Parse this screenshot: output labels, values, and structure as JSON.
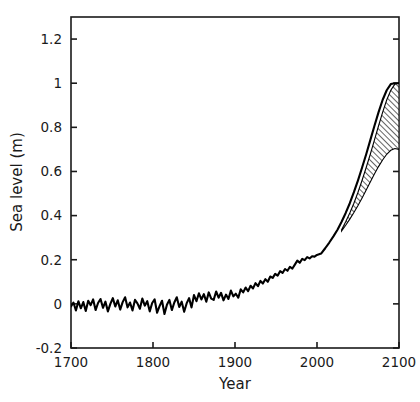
{
  "chart_data": {
    "type": "line",
    "title": "",
    "xlabel": "Year",
    "ylabel": "Sea level (m)",
    "xlim": [
      1700,
      2100
    ],
    "ylim": [
      -0.2,
      1.3
    ],
    "grid": false,
    "legend": null,
    "xticks": [
      1700,
      1800,
      1900,
      2000,
      2100
    ],
    "xtick_labels": [
      "1700",
      "1800",
      "1900",
      "2000",
      "2100"
    ],
    "yticks": [
      -0.2,
      0,
      0.2,
      0.4,
      0.6,
      0.8,
      1.0,
      1.2
    ],
    "ytick_labels": [
      "-0.2",
      "0",
      "0.2",
      "0.4",
      "0.6",
      "0.8",
      "1",
      "1.2"
    ],
    "series": [
      {
        "name": "Reconstructed and projected sea level",
        "type": "line",
        "color": "#000000",
        "x": [
          1700,
          1703,
          1706,
          1709,
          1712,
          1715,
          1718,
          1721,
          1724,
          1727,
          1730,
          1733,
          1736,
          1739,
          1742,
          1745,
          1748,
          1751,
          1754,
          1757,
          1760,
          1763,
          1766,
          1769,
          1772,
          1775,
          1778,
          1781,
          1784,
          1787,
          1790,
          1793,
          1796,
          1799,
          1802,
          1805,
          1808,
          1811,
          1814,
          1817,
          1820,
          1823,
          1826,
          1829,
          1832,
          1835,
          1838,
          1841,
          1844,
          1847,
          1850,
          1853,
          1856,
          1859,
          1862,
          1865,
          1868,
          1871,
          1874,
          1877,
          1880,
          1883,
          1886,
          1889,
          1892,
          1895,
          1898,
          1901,
          1904,
          1907,
          1910,
          1913,
          1916,
          1919,
          1922,
          1925,
          1928,
          1931,
          1934,
          1937,
          1940,
          1943,
          1946,
          1949,
          1952,
          1955,
          1958,
          1961,
          1964,
          1967,
          1970,
          1973,
          1976,
          1979,
          1982,
          1985,
          1988,
          1991,
          1994,
          1997,
          2000,
          2005,
          2010,
          2015,
          2020,
          2025,
          2030,
          2035,
          2040,
          2045,
          2050,
          2055,
          2060,
          2065,
          2070,
          2075,
          2080,
          2085,
          2090,
          2095,
          2100
        ],
        "y": [
          -0.012,
          0.006,
          -0.03,
          0.012,
          -0.02,
          0.008,
          -0.032,
          0.014,
          -0.006,
          0.02,
          -0.028,
          0.004,
          0.022,
          -0.018,
          0.01,
          -0.034,
          0.0,
          0.026,
          -0.012,
          0.016,
          -0.026,
          0.008,
          0.03,
          -0.016,
          0.006,
          -0.03,
          0.018,
          0.002,
          -0.022,
          0.024,
          -0.008,
          0.012,
          -0.034,
          0.004,
          0.02,
          -0.04,
          -0.01,
          0.014,
          -0.046,
          -0.004,
          0.018,
          -0.028,
          0.006,
          0.03,
          -0.014,
          0.01,
          -0.036,
          0.002,
          0.026,
          -0.016,
          0.04,
          0.012,
          0.048,
          0.02,
          0.044,
          0.01,
          0.052,
          0.024,
          0.018,
          0.056,
          0.028,
          0.05,
          0.016,
          0.042,
          0.022,
          0.06,
          0.034,
          0.046,
          0.028,
          0.066,
          0.052,
          0.074,
          0.058,
          0.082,
          0.07,
          0.094,
          0.08,
          0.104,
          0.092,
          0.112,
          0.1,
          0.124,
          0.118,
          0.136,
          0.128,
          0.148,
          0.14,
          0.158,
          0.15,
          0.168,
          0.16,
          0.178,
          0.196,
          0.186,
          0.204,
          0.198,
          0.212,
          0.206,
          0.216,
          0.214,
          0.222,
          0.228,
          0.252,
          0.278,
          0.306,
          0.336,
          0.372,
          0.412,
          0.456,
          0.506,
          0.56,
          0.618,
          0.678,
          0.742,
          0.806,
          0.868,
          0.924,
          0.968,
          0.996,
          1.0,
          1.0
        ]
      }
    ],
    "uncertainty_band": {
      "name": "Projection uncertainty range",
      "hatch": "/",
      "edge_color": "#000000",
      "face_color": "#ffffff",
      "start_year": 2030,
      "end_year": 2100,
      "x": [
        2030,
        2035,
        2040,
        2045,
        2050,
        2055,
        2060,
        2065,
        2070,
        2075,
        2080,
        2085,
        2090,
        2095,
        2100
      ],
      "upper": [
        0.336,
        0.372,
        0.412,
        0.456,
        0.506,
        0.56,
        0.618,
        0.678,
        0.742,
        0.806,
        0.868,
        0.924,
        0.968,
        0.996,
        1.0
      ],
      "lower": [
        0.33,
        0.356,
        0.384,
        0.414,
        0.446,
        0.48,
        0.516,
        0.552,
        0.588,
        0.622,
        0.652,
        0.678,
        0.696,
        0.704,
        0.7
      ]
    },
    "annotations": []
  },
  "axes": {
    "x_title": "Year",
    "y_title": "Sea level (m)"
  }
}
